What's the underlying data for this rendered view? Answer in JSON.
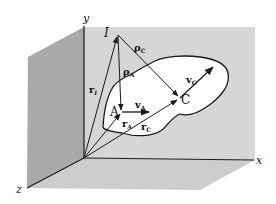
{
  "colors": {
    "background": "#ffffff",
    "back_wall": "#d6d6d6",
    "left_wall": "#a8a8a8",
    "floor": "#cfcfcf",
    "body": "#ffffff",
    "line": "#1a1a1a"
  },
  "axes": {
    "x_label": "x",
    "y_label": "y",
    "z_label": "z"
  },
  "points": {
    "instant_center": "I",
    "point_a": "A",
    "point_c": "C"
  },
  "vectors": {
    "r_i": {
      "main": "r",
      "sub": "I"
    },
    "r_a": {
      "main": "r",
      "sub": "A"
    },
    "r_c": {
      "main": "r",
      "sub": "C"
    },
    "rho_a": {
      "main": "ρ",
      "sub": "A"
    },
    "rho_c": {
      "main": "ρ",
      "sub": "C"
    },
    "v_a": {
      "main": "v",
      "sub": "A"
    },
    "v_c": {
      "main": "v",
      "sub": "C"
    }
  }
}
